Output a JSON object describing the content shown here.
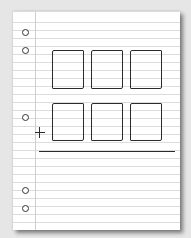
{
  "scene": {
    "description": "Notebook paper sketch of an addition layout: two rows of three empty digit boxes, a plus sign, and a sum rule",
    "paper_color": "#ffffff",
    "line_color": "#dcdcdc",
    "ink_color": "#2b2b2b",
    "background_color": "#e6e6e6"
  },
  "holes": [
    {
      "x": 22,
      "y": 29
    },
    {
      "x": 22,
      "y": 47
    },
    {
      "x": 22,
      "y": 114
    },
    {
      "x": 22,
      "y": 187
    },
    {
      "x": 22,
      "y": 205
    }
  ],
  "rows": [
    {
      "name": "addend-top",
      "boxes": [
        {
          "x": 52,
          "y": 50,
          "w": 32,
          "h": 39
        },
        {
          "x": 91,
          "y": 50,
          "w": 32,
          "h": 39
        },
        {
          "x": 130,
          "y": 50,
          "w": 32,
          "h": 39
        }
      ]
    },
    {
      "name": "addend-bottom",
      "boxes": [
        {
          "x": 52,
          "y": 103,
          "w": 32,
          "h": 38
        },
        {
          "x": 91,
          "y": 103,
          "w": 32,
          "h": 38
        },
        {
          "x": 130,
          "y": 103,
          "w": 32,
          "h": 38
        }
      ]
    }
  ],
  "operator": {
    "symbol": "+"
  },
  "sum_rule": {
    "x": 39,
    "y": 151,
    "w": 136
  }
}
